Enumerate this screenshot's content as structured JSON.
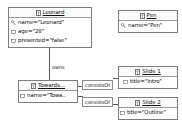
{
  "diagram": {
    "type": "object-diagram",
    "background": "#ffffff",
    "line_color": "#5a5a5a",
    "border_color": "#7d7d7d",
    "text_color": "#101010",
    "nodes": [
      {
        "id": "leonard",
        "title": "Leonard",
        "title_icon": "table-icon",
        "attributes": [
          {
            "text": "name=\"Leonard\"",
            "icon": "key-icon"
          },
          {
            "text": "age=\"28\"",
            "icon": "column-icon"
          },
          {
            "text": "presented=\"false\"",
            "icon": "column-icon"
          }
        ]
      },
      {
        "id": "pen",
        "title": "Pen",
        "title_icon": "table-icon",
        "attributes": [
          {
            "text": "name=\"Pen\"",
            "icon": "key-icon"
          }
        ]
      },
      {
        "id": "towards",
        "title": "Towards...",
        "title_icon": "table-icon",
        "attributes": [
          {
            "text": "name=\"Towa..",
            "icon": "column-icon"
          }
        ]
      },
      {
        "id": "slide1",
        "title": "Slide 1",
        "title_icon": "table-icon",
        "attributes": [
          {
            "text": "title=\"Intro\"",
            "icon": "column-icon"
          }
        ]
      },
      {
        "id": "slide2",
        "title": "Slide 2",
        "title_icon": "table-icon",
        "attributes": [
          {
            "text": "title=\"Outline\"",
            "icon": "column-icon"
          }
        ]
      }
    ],
    "edges": [
      {
        "id": "owns",
        "label": "owns",
        "from": "leonard",
        "to": "towards"
      },
      {
        "id": "consists1",
        "label": "consistsOf",
        "from": "towards",
        "to": "slide1"
      },
      {
        "id": "consists2",
        "label": "consistsOf",
        "from": "towards",
        "to": "slide2"
      }
    ]
  }
}
